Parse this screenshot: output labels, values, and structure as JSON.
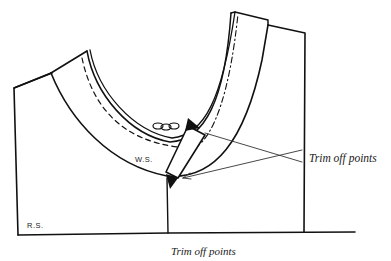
{
  "diagram": {
    "labels": {
      "wrong_side": "W.S.",
      "right_side": "R.S.",
      "callout": "Trim off points",
      "caption": "Trim off points"
    },
    "colors": {
      "ink": "#111111",
      "background": "#ffffff",
      "leader": "#333333"
    }
  }
}
